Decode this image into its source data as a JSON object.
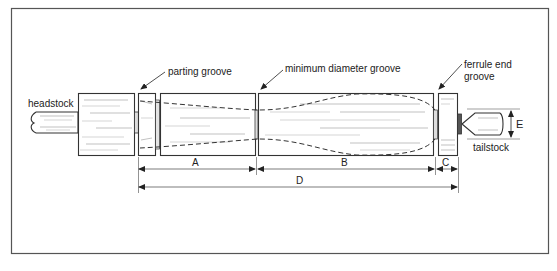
{
  "figure": {
    "colors": {
      "line": "#333333",
      "border": "#555555",
      "grain": "#9a9a9a",
      "background": "#ffffff"
    }
  },
  "labels": {
    "headstock": "headstock",
    "tailstock": "tailstock",
    "parting_groove": "parting groove",
    "minimum_diameter_groove": "minimum diameter groove",
    "ferrule_end_line1": "ferrule end",
    "ferrule_end_line2": "groove"
  },
  "dimensions": {
    "A": "A",
    "B": "B",
    "C": "C",
    "D": "D",
    "E": "E"
  }
}
